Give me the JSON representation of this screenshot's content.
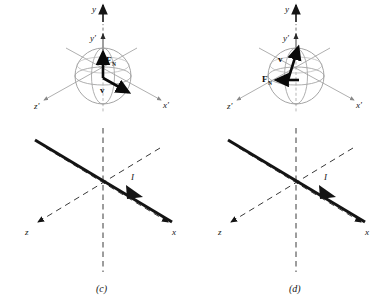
{
  "figure": {
    "background_color": "#ffffff",
    "ink_color": "#141414",
    "sphere_color": "#9a9a9a",
    "axis_dash_color": "#4a4a4a",
    "panels": [
      {
        "id": "c",
        "caption": "(c)",
        "upper": {
          "description": "velocity-selector sphere with primed axes",
          "axes": [
            {
              "name": "y-axis",
              "label": "y",
              "primed": false,
              "direction": "up"
            },
            {
              "name": "y-prime-axis",
              "label": "y′",
              "primed": true,
              "direction": "up"
            },
            {
              "name": "x-prime-axis",
              "label": "x′",
              "primed": true,
              "direction": "down-right"
            },
            {
              "name": "z-prime-axis",
              "label": "z′",
              "primed": true,
              "direction": "down-left"
            }
          ],
          "vectors": [
            {
              "name": "force-vector",
              "label": "F",
              "subscript": "N",
              "direction": "up",
              "style": "solid-bold"
            },
            {
              "name": "velocity-vector",
              "label": "v",
              "subscript": "",
              "direction": "down-right",
              "style": "solid-bold"
            }
          ]
        },
        "lower": {
          "description": "current-carrying wire along primed axes",
          "axes": [
            {
              "name": "y-axis-dashed",
              "label": "",
              "direction": "vertical"
            },
            {
              "name": "x-axis",
              "label": "x",
              "direction": "down-right"
            },
            {
              "name": "z-axis",
              "label": "z",
              "direction": "down-left"
            }
          ],
          "current": {
            "name": "current-arrow",
            "label": "I",
            "direction": "down-right"
          }
        }
      },
      {
        "id": "d",
        "caption": "(d)",
        "upper": {
          "description": "velocity-selector sphere with primed axes",
          "axes": [
            {
              "name": "y-axis",
              "label": "y",
              "primed": false,
              "direction": "up"
            },
            {
              "name": "y-prime-axis",
              "label": "y′",
              "primed": true,
              "direction": "up"
            },
            {
              "name": "x-prime-axis",
              "label": "x′",
              "primed": true,
              "direction": "down-right"
            },
            {
              "name": "z-prime-axis",
              "label": "z′",
              "primed": true,
              "direction": "down-left"
            }
          ],
          "vectors": [
            {
              "name": "velocity-vector",
              "label": "v",
              "subscript": "",
              "direction": "up-right",
              "style": "solid-bold"
            },
            {
              "name": "force-vector",
              "label": "F",
              "subscript": "N",
              "direction": "left",
              "style": "solid-bold"
            }
          ]
        },
        "lower": {
          "description": "current-carrying wire along primed axes",
          "axes": [
            {
              "name": "y-axis-dashed",
              "label": "",
              "direction": "vertical"
            },
            {
              "name": "x-axis",
              "label": "x",
              "direction": "down-right"
            },
            {
              "name": "z-axis",
              "label": "z",
              "direction": "down-left"
            }
          ],
          "current": {
            "name": "current-arrow",
            "label": "I",
            "direction": "down-right"
          }
        }
      }
    ]
  }
}
